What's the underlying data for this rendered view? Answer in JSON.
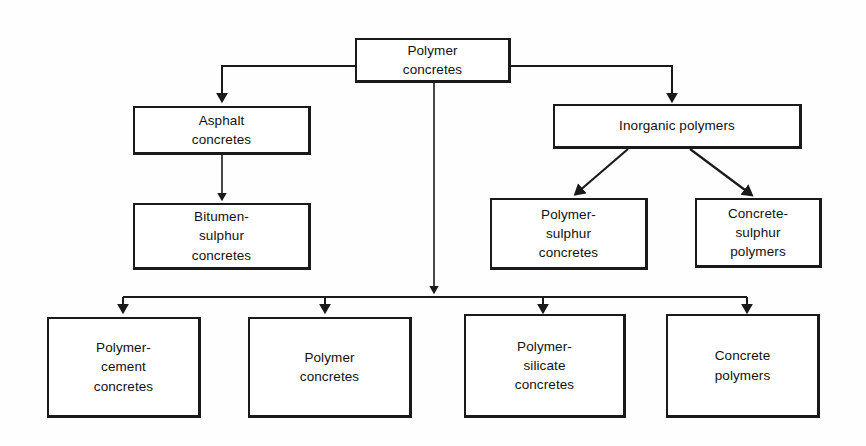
{
  "diagram": {
    "type": "flowchart-tree",
    "stroke_color": "#1a1a1a",
    "background_color": "#fefefe",
    "text_color": "#111111",
    "nodes": [
      {
        "id": "root",
        "label": "Polymer\nconcretes",
        "level": 0
      },
      {
        "id": "asphalt",
        "label": "Asphalt\nconcretes",
        "level": 1
      },
      {
        "id": "inorganic",
        "label": "Inorganic   polymers",
        "level": 1
      },
      {
        "id": "bitumen-sulphur",
        "label": "Bitumen-\nsulphur\nconcretes",
        "level": 2
      },
      {
        "id": "polymer-sulphur",
        "label": "Polymer-\nsulphur\nconcretes",
        "level": 2
      },
      {
        "id": "concrete-sulphur",
        "label": "Concrete-\nsulphur\npolymers",
        "level": 2
      },
      {
        "id": "polymer-cement",
        "label": "Polymer-\ncement\nconcretes",
        "level": 1
      },
      {
        "id": "polymer-concretes",
        "label": "Polymer\nconcretes",
        "level": 1
      },
      {
        "id": "polymer-silicate",
        "label": "Polymer-\nsilicate\nconcretes",
        "level": 1
      },
      {
        "id": "concrete-polymers",
        "label": "Concrete\npolymers",
        "level": 1
      }
    ],
    "edges": [
      {
        "from": "root",
        "to": "asphalt",
        "style": "elbow-left-down"
      },
      {
        "from": "root",
        "to": "inorganic",
        "style": "elbow-right-down"
      },
      {
        "from": "root",
        "to": "bottom-bus",
        "style": "straight-down"
      },
      {
        "from": "asphalt",
        "to": "bitumen-sulphur",
        "style": "straight-down"
      },
      {
        "from": "inorganic",
        "to": "polymer-sulphur",
        "style": "diagonal-down-left"
      },
      {
        "from": "inorganic",
        "to": "concrete-sulphur",
        "style": "diagonal-down-right"
      },
      {
        "from": "bottom-bus",
        "to": "polymer-cement",
        "style": "straight-down"
      },
      {
        "from": "bottom-bus",
        "to": "polymer-concretes",
        "style": "straight-down"
      },
      {
        "from": "bottom-bus",
        "to": "polymer-silicate",
        "style": "straight-down"
      },
      {
        "from": "bottom-bus",
        "to": "concrete-polymers",
        "style": "straight-down"
      }
    ]
  }
}
